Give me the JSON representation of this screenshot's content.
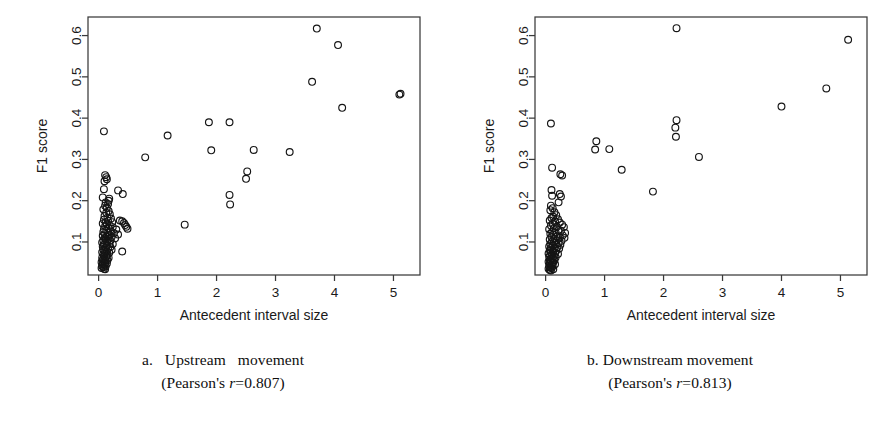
{
  "figure": {
    "panel_count": 2
  },
  "panels": [
    {
      "id": "a",
      "caption_line1": "a.   Upstream   movement",
      "caption_line2_pre": "(Pearson's ",
      "caption_line2_sym": "r",
      "caption_line2_post": "=0.807)",
      "caption_full": "a. Upstream movement (Pearson's r=0.807)",
      "pearson_r": 0.807,
      "chart_data": {
        "type": "scatter",
        "title": "",
        "xlabel": "Antecedent interval size",
        "ylabel": "F1 score",
        "xlim": [
          -0.18,
          5.45
        ],
        "ylim": [
          0.02,
          0.645
        ],
        "xticks": [
          0,
          1,
          2,
          3,
          4,
          5
        ],
        "xticklabels": [
          "0",
          "1",
          "2",
          "3",
          "4",
          "5"
        ],
        "yticks": [
          0.1,
          0.2,
          0.3,
          0.4,
          0.5,
          0.6
        ],
        "yticklabels": [
          "0.1",
          "0.2",
          "0.3",
          "0.4",
          "0.5",
          "0.6"
        ],
        "grid": false,
        "legend": null,
        "marker": "open-circle",
        "marker_size": 3.4,
        "series": [
          {
            "name": "Upstream movement",
            "points": [
              [
                3.7,
                0.617
              ],
              [
                4.06,
                0.577
              ],
              [
                3.62,
                0.488
              ],
              [
                5.1,
                0.457
              ],
              [
                5.12,
                0.459
              ],
              [
                4.13,
                0.425
              ],
              [
                1.87,
                0.39
              ],
              [
                2.22,
                0.39
              ],
              [
                0.09,
                0.368
              ],
              [
                1.17,
                0.358
              ],
              [
                1.91,
                0.322
              ],
              [
                2.63,
                0.323
              ],
              [
                3.24,
                0.318
              ],
              [
                0.79,
                0.305
              ],
              [
                2.52,
                0.271
              ],
              [
                2.5,
                0.253
              ],
              [
                0.11,
                0.262
              ],
              [
                0.13,
                0.257
              ],
              [
                0.14,
                0.252
              ],
              [
                0.1,
                0.247
              ],
              [
                0.09,
                0.228
              ],
              [
                0.33,
                0.225
              ],
              [
                0.41,
                0.216
              ],
              [
                2.22,
                0.214
              ],
              [
                0.07,
                0.208
              ],
              [
                0.18,
                0.205
              ],
              [
                2.23,
                0.191
              ],
              [
                0.17,
                0.2
              ],
              [
                0.12,
                0.196
              ],
              [
                0.16,
                0.192
              ],
              [
                0.11,
                0.188
              ],
              [
                0.14,
                0.183
              ],
              [
                0.08,
                0.179
              ],
              [
                0.17,
                0.175
              ],
              [
                0.13,
                0.171
              ],
              [
                0.19,
                0.167
              ],
              [
                0.1,
                0.163
              ],
              [
                0.15,
                0.159
              ],
              [
                0.21,
                0.157
              ],
              [
                0.09,
                0.154
              ],
              [
                0.16,
                0.151
              ],
              [
                0.12,
                0.148
              ],
              [
                0.23,
                0.148
              ],
              [
                0.4,
                0.15
              ],
              [
                0.43,
                0.146
              ],
              [
                0.45,
                0.141
              ],
              [
                0.47,
                0.137
              ],
              [
                0.49,
                0.132
              ],
              [
                0.36,
                0.152
              ],
              [
                1.46,
                0.142
              ],
              [
                0.07,
                0.145
              ],
              [
                0.14,
                0.143
              ],
              [
                0.19,
                0.14
              ],
              [
                0.11,
                0.138
              ],
              [
                0.24,
                0.136
              ],
              [
                0.17,
                0.133
              ],
              [
                0.09,
                0.131
              ],
              [
                0.3,
                0.13
              ],
              [
                0.13,
                0.128
              ],
              [
                0.21,
                0.126
              ],
              [
                0.08,
                0.124
              ],
              [
                0.16,
                0.122
              ],
              [
                0.26,
                0.121
              ],
              [
                0.11,
                0.119
              ],
              [
                0.19,
                0.117
              ],
              [
                0.33,
                0.118
              ],
              [
                0.07,
                0.115
              ],
              [
                0.14,
                0.113
              ],
              [
                0.22,
                0.112
              ],
              [
                0.1,
                0.11
              ],
              [
                0.17,
                0.108
              ],
              [
                0.28,
                0.109
              ],
              [
                0.12,
                0.106
              ],
              [
                0.08,
                0.104
              ],
              [
                0.2,
                0.103
              ],
              [
                0.15,
                0.101
              ],
              [
                0.06,
                0.099
              ],
              [
                0.11,
                0.097
              ],
              [
                0.18,
                0.096
              ],
              [
                0.24,
                0.095
              ],
              [
                0.09,
                0.093
              ],
              [
                0.14,
                0.091
              ],
              [
                0.07,
                0.089
              ],
              [
                0.2,
                0.088
              ],
              [
                0.12,
                0.086
              ],
              [
                0.4,
                0.077
              ],
              [
                0.16,
                0.084
              ],
              [
                0.08,
                0.082
              ],
              [
                0.22,
                0.081
              ],
              [
                0.1,
                0.079
              ],
              [
                0.14,
                0.077
              ],
              [
                0.06,
                0.075
              ],
              [
                0.18,
                0.074
              ],
              [
                0.11,
                0.072
              ],
              [
                0.08,
                0.07
              ],
              [
                0.15,
                0.069
              ],
              [
                0.09,
                0.066
              ],
              [
                0.13,
                0.064
              ],
              [
                0.06,
                0.062
              ],
              [
                0.17,
                0.062
              ],
              [
                0.1,
                0.059
              ],
              [
                0.07,
                0.057
              ],
              [
                0.12,
                0.055
              ],
              [
                0.15,
                0.056
              ],
              [
                0.09,
                0.053
              ],
              [
                0.05,
                0.051
              ],
              [
                0.11,
                0.049
              ],
              [
                0.14,
                0.048
              ],
              [
                0.07,
                0.046
              ],
              [
                0.1,
                0.044
              ],
              [
                0.06,
                0.042
              ],
              [
                0.12,
                0.041
              ],
              [
                0.08,
                0.039
              ],
              [
                0.05,
                0.037
              ],
              [
                0.09,
                0.035
              ],
              [
                0.11,
                0.034
              ]
            ]
          }
        ]
      }
    },
    {
      "id": "b",
      "caption_line1": "b. Downstream movement",
      "caption_line2_pre": "(Pearson's ",
      "caption_line2_sym": "r",
      "caption_line2_post": "=0.813)",
      "caption_full": "b. Downstream movement (Pearson's r=0.813)",
      "pearson_r": 0.813,
      "chart_data": {
        "type": "scatter",
        "title": "",
        "xlabel": "Antecedent interval size",
        "ylabel": "F1 score",
        "xlim": [
          -0.18,
          5.45
        ],
        "ylim": [
          0.02,
          0.645
        ],
        "xticks": [
          0,
          1,
          2,
          3,
          4,
          5
        ],
        "xticklabels": [
          "0",
          "1",
          "2",
          "3",
          "4",
          "5"
        ],
        "yticks": [
          0.1,
          0.2,
          0.3,
          0.4,
          0.5,
          0.6
        ],
        "yticklabels": [
          "0.1",
          "0.2",
          "0.3",
          "0.4",
          "0.5",
          "0.6"
        ],
        "grid": false,
        "legend": null,
        "marker": "open-circle",
        "marker_size": 3.4,
        "series": [
          {
            "name": "Downstream movement",
            "points": [
              [
                2.22,
                0.618
              ],
              [
                5.13,
                0.59
              ],
              [
                4.76,
                0.472
              ],
              [
                4.0,
                0.428
              ],
              [
                2.22,
                0.395
              ],
              [
                2.2,
                0.377
              ],
              [
                2.21,
                0.355
              ],
              [
                0.09,
                0.387
              ],
              [
                0.86,
                0.344
              ],
              [
                0.84,
                0.324
              ],
              [
                1.08,
                0.325
              ],
              [
                2.6,
                0.306
              ],
              [
                1.29,
                0.275
              ],
              [
                0.11,
                0.28
              ],
              [
                0.25,
                0.264
              ],
              [
                0.28,
                0.261
              ],
              [
                1.82,
                0.222
              ],
              [
                0.1,
                0.226
              ],
              [
                0.24,
                0.216
              ],
              [
                0.11,
                0.212
              ],
              [
                0.26,
                0.21
              ],
              [
                0.22,
                0.196
              ],
              [
                0.09,
                0.188
              ],
              [
                0.12,
                0.182
              ],
              [
                0.08,
                0.177
              ],
              [
                0.15,
                0.172
              ],
              [
                0.18,
                0.165
              ],
              [
                0.13,
                0.161
              ],
              [
                0.1,
                0.158
              ],
              [
                0.21,
                0.155
              ],
              [
                0.07,
                0.152
              ],
              [
                0.16,
                0.149
              ],
              [
                0.24,
                0.147
              ],
              [
                0.12,
                0.144
              ],
              [
                0.28,
                0.142
              ],
              [
                0.09,
                0.14
              ],
              [
                0.19,
                0.137
              ],
              [
                0.31,
                0.136
              ],
              [
                0.14,
                0.133
              ],
              [
                0.06,
                0.131
              ],
              [
                0.22,
                0.129
              ],
              [
                0.26,
                0.127
              ],
              [
                0.11,
                0.125
              ],
              [
                0.17,
                0.123
              ],
              [
                0.33,
                0.122
              ],
              [
                0.08,
                0.12
              ],
              [
                0.13,
                0.118
              ],
              [
                0.29,
                0.116
              ],
              [
                0.2,
                0.114
              ],
              [
                0.1,
                0.112
              ],
              [
                0.24,
                0.111
              ],
              [
                0.32,
                0.11
              ],
              [
                0.15,
                0.108
              ],
              [
                0.07,
                0.106
              ],
              [
                0.19,
                0.104
              ],
              [
                0.27,
                0.103
              ],
              [
                0.11,
                0.101
              ],
              [
                0.14,
                0.099
              ],
              [
                0.22,
                0.097
              ],
              [
                0.08,
                0.095
              ],
              [
                0.17,
                0.094
              ],
              [
                0.25,
                0.093
              ],
              [
                0.12,
                0.091
              ],
              [
                0.06,
                0.089
              ],
              [
                0.2,
                0.088
              ],
              [
                0.09,
                0.086
              ],
              [
                0.15,
                0.085
              ],
              [
                0.23,
                0.084
              ],
              [
                0.11,
                0.082
              ],
              [
                0.07,
                0.08
              ],
              [
                0.18,
                0.079
              ],
              [
                0.13,
                0.077
              ],
              [
                0.09,
                0.075
              ],
              [
                0.16,
                0.074
              ],
              [
                0.05,
                0.072
              ],
              [
                0.21,
                0.071
              ],
              [
                0.11,
                0.069
              ],
              [
                0.08,
                0.067
              ],
              [
                0.14,
                0.066
              ],
              [
                0.06,
                0.064
              ],
              [
                0.17,
                0.063
              ],
              [
                0.1,
                0.061
              ],
              [
                0.12,
                0.059
              ],
              [
                0.07,
                0.057
              ],
              [
                0.15,
                0.056
              ],
              [
                0.09,
                0.054
              ],
              [
                0.05,
                0.052
              ],
              [
                0.13,
                0.051
              ],
              [
                0.11,
                0.049
              ],
              [
                0.07,
                0.047
              ],
              [
                0.16,
                0.046
              ],
              [
                0.09,
                0.044
              ],
              [
                0.06,
                0.042
              ],
              [
                0.12,
                0.041
              ],
              [
                0.08,
                0.039
              ],
              [
                0.1,
                0.037
              ],
              [
                0.05,
                0.035
              ],
              [
                0.13,
                0.034
              ],
              [
                0.07,
                0.032
              ],
              [
                0.09,
                0.031
              ]
            ]
          }
        ]
      }
    }
  ]
}
